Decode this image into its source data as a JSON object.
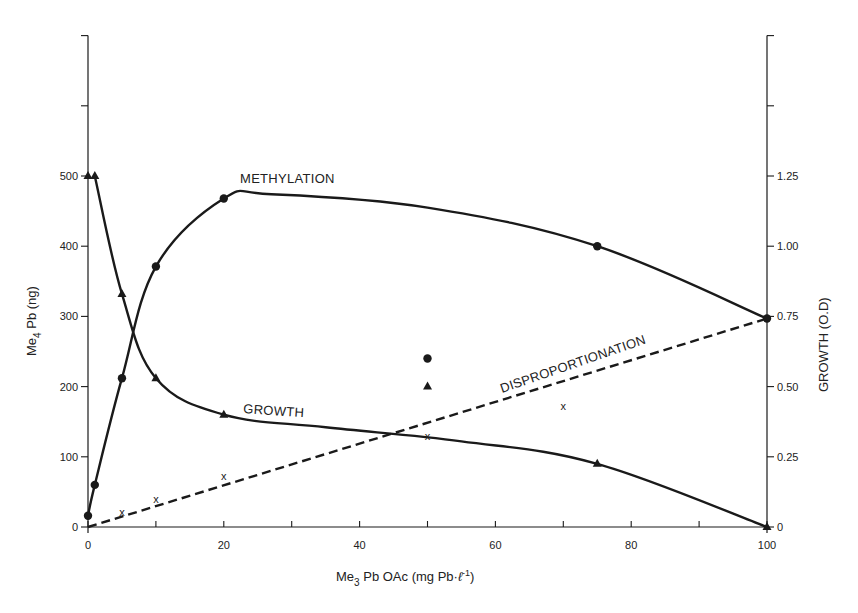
{
  "chart_data": {
    "type": "line",
    "title": "",
    "xlabel": "Me3 Pb OAc (mg Pb·l⁻¹)",
    "xlabel_parts": {
      "main": "Me",
      "sub": "3",
      "rest": " Pb OAc  (mg Pb·",
      "ell": "ℓ",
      "sup": "-1",
      "end": ")"
    },
    "ylabel_left": "Me4 Pb (ng)",
    "ylabel_left_parts": {
      "main": "Me",
      "sub": "4",
      "rest": " Pb  (ng)"
    },
    "ylabel_right": "GROWTH  (O.D)",
    "xlim": [
      0,
      100
    ],
    "ylim_left": [
      0,
      700
    ],
    "ylim_right": [
      0,
      1.75
    ],
    "grid": false,
    "legend": "none (inline curve labels)",
    "x_ticks": [
      0,
      10,
      20,
      30,
      40,
      50,
      60,
      70,
      80,
      90,
      100
    ],
    "x_tick_labels": [
      "0",
      "",
      "20",
      "",
      "40",
      "",
      "60",
      "",
      "80",
      "",
      "100"
    ],
    "y_left_ticks": [
      0,
      100,
      200,
      300,
      400,
      500,
      600,
      700
    ],
    "y_left_tick_labels": [
      "0",
      "100",
      "200",
      "300",
      "400",
      "500",
      "",
      ""
    ],
    "y_right_ticks": [
      0,
      0.25,
      0.5,
      0.75,
      1.0,
      1.25,
      1.5,
      1.75
    ],
    "y_right_tick_labels": [
      "0",
      "0.25",
      "0.50",
      "0.75",
      "1.00",
      "1.25",
      "",
      ""
    ],
    "series": [
      {
        "name": "METHYLATION",
        "axis": "left",
        "marker": "circle",
        "line": "solid",
        "x": [
          0,
          1,
          5,
          10,
          20,
          75,
          100
        ],
        "values": [
          16,
          60,
          212,
          371,
          468,
          400,
          297
        ],
        "outliers": [
          {
            "x": 50,
            "y": 240
          }
        ]
      },
      {
        "name": "GROWTH",
        "axis": "right",
        "marker": "triangle",
        "line": "solid",
        "x": [
          0,
          1,
          5,
          10,
          20,
          75,
          100
        ],
        "values": [
          1.25,
          1.25,
          0.83,
          0.53,
          0.4,
          0.225,
          0.0
        ],
        "outliers": [
          {
            "x": 50,
            "y": 0.5
          }
        ]
      },
      {
        "name": "DISPROPORTIONATION",
        "axis": "left",
        "marker": "x",
        "line": "dashed",
        "x": [
          5,
          10,
          20,
          50,
          70
        ],
        "values": [
          22,
          40,
          73,
          130,
          172
        ],
        "fit_line": {
          "x": [
            0,
            100
          ],
          "y": [
            0,
            297
          ]
        }
      }
    ],
    "annotations": [
      "METHYLATION",
      "GROWTH",
      "DISPROPORTIONATION"
    ]
  }
}
